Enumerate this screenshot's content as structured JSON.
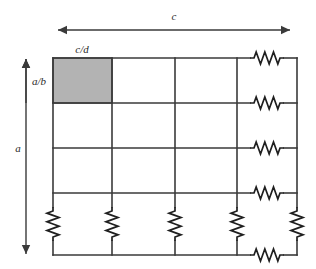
{
  "figure": {
    "type": "resistive-grid-network-diagram",
    "title": "",
    "background_color": "#ffffff",
    "line_color": "#3a3a3a",
    "shaded_cell_color": "#b3b3b3",
    "shaded_cell_border_color": "#4a4a4a",
    "label_color": "#2b2b2b",
    "grid": {
      "columns": 4,
      "rows": 4,
      "x_lines": [
        53,
        112,
        175,
        237,
        297
      ],
      "y_lines": [
        58,
        103,
        148,
        193,
        255
      ],
      "left": 53,
      "right": 297,
      "top": 58,
      "bottom": 255
    },
    "shaded_cell": {
      "x": 53,
      "y": 58,
      "width": 59,
      "height": 45,
      "row": 1,
      "column": 1
    },
    "labels": {
      "width_total": "c",
      "cell_width": "c/d",
      "cell_height": "a/b",
      "height_total": "a"
    },
    "arrows": {
      "width_total": {
        "orientation": "horizontal",
        "x1": 58,
        "x2": 290,
        "y": 30,
        "double_headed": true,
        "label": "c",
        "label_x": 174,
        "label_y": 20
      },
      "height_total": {
        "orientation": "vertical",
        "x": 26,
        "y1": 59,
        "y2": 254,
        "double_headed": true,
        "label": "a",
        "label_x": 16,
        "label_y": 152
      },
      "cell_height": {
        "orientation": "vertical",
        "x": 26,
        "y1": 59,
        "y2": 103,
        "double_headed": false,
        "label": "a/b",
        "label_x": 32,
        "label_y": 85
      },
      "cell_width": {
        "orientation": "none",
        "label": "c/d",
        "label_x": 70,
        "label_y": 53
      }
    },
    "resistors": {
      "count_horizontal": 5,
      "count_vertical": 5,
      "horizontal": [
        {
          "id": "r-h-1",
          "cx": 267,
          "cy": 58,
          "row": "top-edge",
          "column": "right"
        },
        {
          "id": "r-h-2",
          "cx": 267,
          "cy": 103,
          "row": "2",
          "column": "right"
        },
        {
          "id": "r-h-3",
          "cx": 267,
          "cy": 148,
          "row": "3",
          "column": "right"
        },
        {
          "id": "r-h-4",
          "cx": 267,
          "cy": 193,
          "row": "4",
          "column": "right"
        },
        {
          "id": "r-h-5",
          "cx": 267,
          "cy": 255,
          "row": "bottom-edge",
          "column": "right"
        }
      ],
      "vertical": [
        {
          "id": "r-v-1",
          "cx": 53,
          "cy": 224,
          "row": "bottom",
          "column": "1"
        },
        {
          "id": "r-v-2",
          "cx": 112,
          "cy": 224,
          "row": "bottom",
          "column": "2"
        },
        {
          "id": "r-v-3",
          "cx": 175,
          "cy": 224,
          "row": "bottom",
          "column": "3"
        },
        {
          "id": "r-v-4",
          "cx": 237,
          "cy": 224,
          "row": "bottom",
          "column": "4"
        },
        {
          "id": "r-v-5",
          "cx": 297,
          "cy": 224,
          "row": "bottom",
          "column": "5"
        }
      ]
    }
  }
}
